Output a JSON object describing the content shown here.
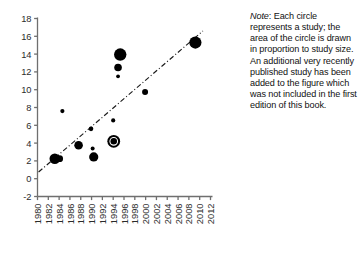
{
  "note": {
    "label": "Note",
    "text": ": Each circle represents a study; the area of the circle is drawn in proportion to study size. An additional very recently published study has been added to the figure which was not included in the first edition of this book."
  },
  "colors": {
    "marker": "#000000",
    "axis": "#6f6f6f",
    "trend": "#1a1a1a",
    "tick_text": "#2b2b2b"
  },
  "chart_data": {
    "type": "scatter",
    "title": "",
    "xlabel": "",
    "ylabel": "",
    "xlim": [
      1980,
      2012
    ],
    "ylim": [
      -2,
      18
    ],
    "xticks": [
      "1980",
      "1982",
      "1984",
      "1986",
      "1988",
      "1990",
      "1992",
      "1994",
      "1996",
      "1998",
      "2000",
      "2002",
      "2004",
      "2006",
      "2008",
      "2010",
      "2012"
    ],
    "yticks": [
      "-2",
      "0",
      "2",
      "4",
      "6",
      "8",
      "10",
      "12",
      "14",
      "16",
      "18"
    ],
    "grid": false,
    "legend": null,
    "xtick_rotation": 90,
    "size_encoding": "circle area proportional to study size",
    "points": [
      {
        "x": 1983.2,
        "y": 2.25,
        "size": 5.3
      },
      {
        "x": 1984.1,
        "y": 2.25,
        "size": 3.4
      },
      {
        "x": 1984.6,
        "y": 7.6,
        "size": 2.1
      },
      {
        "x": 1987.6,
        "y": 3.75,
        "size": 4.3
      },
      {
        "x": 1989.9,
        "y": 5.6,
        "size": 2.3
      },
      {
        "x": 1990.2,
        "y": 3.4,
        "size": 2.0
      },
      {
        "x": 1990.4,
        "y": 2.45,
        "size": 4.6
      },
      {
        "x": 1994.1,
        "y": 4.2,
        "size": 6.4
      },
      {
        "x": 1994.0,
        "y": 6.55,
        "size": 2.1
      },
      {
        "x": 1994.9,
        "y": 11.5,
        "size": 1.9
      },
      {
        "x": 1994.9,
        "y": 12.5,
        "size": 3.8
      },
      {
        "x": 1995.3,
        "y": 13.95,
        "size": 6.2
      },
      {
        "x": 1999.9,
        "y": 9.75,
        "size": 3.0
      },
      {
        "x": 2009.2,
        "y": 15.3,
        "size": 6.1
      }
    ],
    "trend_line": {
      "style": "dash-dot",
      "x_start": 1980.2,
      "y_start": 0.75,
      "x_end": 2010.6,
      "y_end": 16.6
    }
  }
}
